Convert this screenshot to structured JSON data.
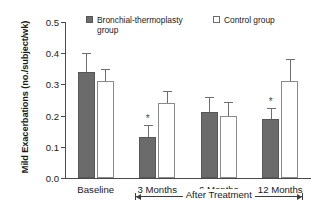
{
  "chart_data": {
    "type": "bar",
    "title": "",
    "xlabel": "",
    "ylabel": "Mild Exacerbations (no./subject/wk)",
    "categories": [
      "Baseline",
      "3 Months",
      "6 Months",
      "12 Months"
    ],
    "ylim": [
      0.0,
      0.5
    ],
    "ytick_labels": [
      "0.5",
      "0.4",
      "0.3",
      "0.2",
      "0.1",
      "0.0"
    ],
    "ytick_values": [
      0.5,
      0.4,
      0.3,
      0.2,
      0.1,
      0.0
    ],
    "ytick_interval": 0.1,
    "grid": false,
    "legend_position": "top",
    "series": [
      {
        "name": "Bronchial-thermoplasty group",
        "color": "#6b6b6b",
        "values": [
          0.34,
          0.13,
          0.21,
          0.19
        ],
        "error_upper": [
          0.4,
          0.17,
          0.26,
          0.225
        ],
        "significance": [
          "",
          "*",
          "",
          "*"
        ]
      },
      {
        "name": "Control group",
        "color": "#ffffff",
        "values": [
          0.31,
          0.24,
          0.2,
          0.31
        ],
        "error_upper": [
          0.35,
          0.28,
          0.245,
          0.38
        ],
        "significance": [
          "",
          "",
          "",
          ""
        ]
      }
    ],
    "annotations": {
      "bracket_label": "After Treatment",
      "bracket_span": [
        "3 Months",
        "12 Months"
      ]
    }
  },
  "legend": {
    "items": [
      {
        "label": "Bronchial-thermoplasty group",
        "swatch": "filled-square-icon"
      },
      {
        "label": "Control group",
        "swatch": "open-square-icon"
      }
    ]
  },
  "axis": {
    "y_title": "Mild Exacerbations (no./subject/wk)",
    "y_ticks": [
      "0.5",
      "0.4",
      "0.3",
      "0.2",
      "0.1",
      "0.0"
    ],
    "x_labels": [
      "Baseline",
      "3 Months",
      "6 Months",
      "12 Months"
    ]
  },
  "bracket": {
    "label": "After Treatment"
  },
  "marks": {
    "star_3months": "*",
    "star_12months": "*"
  }
}
